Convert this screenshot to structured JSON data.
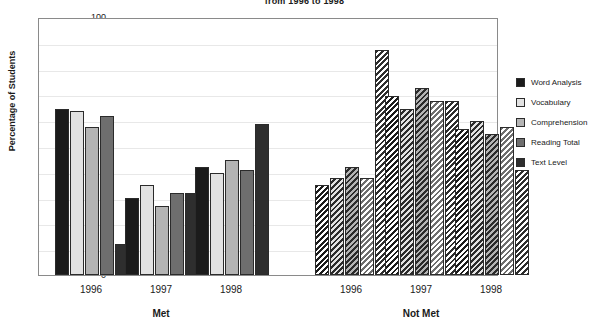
{
  "chart_data": {
    "type": "bar",
    "title": "from 1996 to 1998",
    "xlabel": "",
    "ylabel": "Percentage of Students",
    "ylim": [
      0,
      100
    ],
    "ytick_step": 10,
    "yticks": [
      100,
      90,
      80,
      70,
      60,
      50,
      40,
      30,
      20,
      10,
      0
    ],
    "grid": true,
    "legend_position": "right",
    "sections": [
      "Met",
      "Not Met"
    ],
    "categories": [
      "1996",
      "1997",
      "1998"
    ],
    "series": [
      {
        "name": "Word Analysis",
        "color": "#1b1b1b",
        "pattern": "solid",
        "met": [
          65,
          30,
          42
        ],
        "not_met": [
          35,
          70,
          57
        ]
      },
      {
        "name": "Vocabulary",
        "color": "#e2e2e2",
        "pattern": "solid",
        "met": [
          64,
          35,
          40
        ],
        "not_met": [
          38,
          65,
          60
        ]
      },
      {
        "name": "Comprehension",
        "color": "#b4b4b4",
        "pattern": "solid",
        "met": [
          58,
          27,
          45
        ],
        "not_met": [
          42,
          73,
          55
        ]
      },
      {
        "name": "Reading Total",
        "color": "#6e6e6e",
        "pattern": "solid",
        "met": [
          62,
          32,
          41
        ],
        "not_met": [
          38,
          68,
          58
        ]
      },
      {
        "name": "Text Level",
        "color": "#2e2e2e",
        "pattern": "solid",
        "met": [
          12,
          32,
          59
        ],
        "not_met": [
          88,
          68,
          41
        ]
      }
    ]
  },
  "legend": {
    "items": [
      {
        "label": "Word Analysis"
      },
      {
        "label": "Vocabulary"
      },
      {
        "label": "Comprehension"
      },
      {
        "label": "Reading Total"
      },
      {
        "label": "Text Level"
      }
    ]
  }
}
